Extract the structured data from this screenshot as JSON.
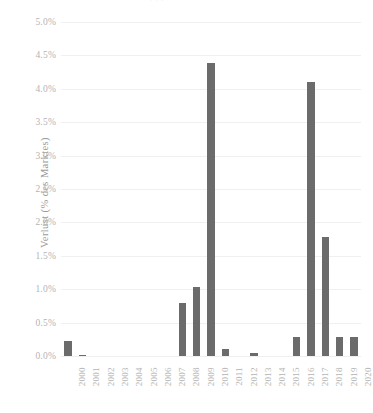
{
  "figure": {
    "title_ghost": "· · ·"
  },
  "chart_data": {
    "type": "bar",
    "title": "",
    "xlabel": "",
    "ylabel": "Verlust (% des Marktes)",
    "categories": [
      "2000",
      "2001",
      "2002",
      "2003",
      "2004",
      "2005",
      "2006",
      "2007",
      "2008",
      "2009",
      "2010",
      "2011",
      "2012",
      "2013",
      "2014",
      "2015",
      "2016",
      "2017",
      "2018",
      "2019",
      "2020"
    ],
    "values": [
      0.22,
      0.02,
      0,
      0,
      0,
      0,
      0,
      0,
      0.8,
      1.03,
      4.38,
      0.1,
      0,
      0.04,
      0,
      0,
      0.28,
      4.1,
      1.78,
      0.28,
      0.28
    ],
    "ylim": [
      0,
      5.0
    ],
    "ytick_labels": [
      "0.0%",
      "0.5%",
      "1.0%",
      "1.5%",
      "2.0%",
      "2.5%",
      "3.0%",
      "3.5%",
      "4.0%",
      "4.5%",
      "5.0%"
    ],
    "ytick_values": [
      0,
      0.5,
      1.0,
      1.5,
      2.0,
      2.5,
      3.0,
      3.5,
      4.0,
      4.5,
      5.0
    ],
    "grid": true,
    "legend": "none",
    "bar_color": "#6b6b6b",
    "grid_color": "#f0f0f2",
    "tick_text_color": "#b4b4b4",
    "axis_label_color": "#9a9a9a"
  }
}
